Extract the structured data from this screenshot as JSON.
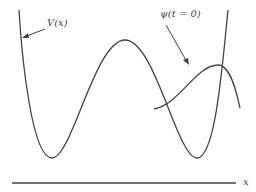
{
  "figure": {
    "type": "diagram",
    "labels": {
      "potential": "V(x)",
      "wavefunction": "ψ(t = 0)",
      "axis": "x"
    },
    "colors": {
      "stroke": "#444444",
      "background": "#ffffff"
    }
  }
}
